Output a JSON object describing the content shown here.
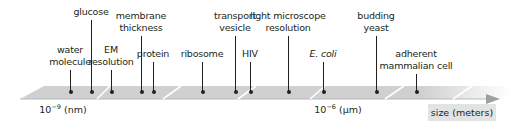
{
  "diagram": {
    "type": "log-scale size ruler",
    "axis_label": "size (meters)",
    "ticks": [
      {
        "base": "10",
        "exp": "−9",
        "unit": "(nm)",
        "x": 63
      },
      {
        "base": "10",
        "exp": "−6",
        "unit": "(µm)",
        "x": 338
      }
    ],
    "items": [
      {
        "label": [
          "water",
          "molecule"
        ],
        "x": 70,
        "line_top": 70,
        "italic": false
      },
      {
        "label": [
          "glucose"
        ],
        "x": 91,
        "line_top": 20,
        "italic": false
      },
      {
        "label": [
          "EM",
          "resolution"
        ],
        "x": 111,
        "line_top": 70,
        "italic": false
      },
      {
        "label": [
          "membrane",
          "thickness"
        ],
        "x": 141,
        "line_top": 36,
        "italic": false
      },
      {
        "label": [
          "protein"
        ],
        "x": 153,
        "line_top": 62,
        "italic": false
      },
      {
        "label": [
          "ribosome"
        ],
        "x": 202,
        "line_top": 62,
        "italic": false
      },
      {
        "label": [
          "transport",
          "vesicle"
        ],
        "x": 235,
        "line_top": 36,
        "italic": false
      },
      {
        "label": [
          "HIV"
        ],
        "x": 250,
        "line_top": 62,
        "italic": false
      },
      {
        "label": [
          "light microscope",
          "resolution"
        ],
        "x": 288,
        "line_top": 36,
        "italic": false
      },
      {
        "label": [
          "E. coli"
        ],
        "x": 323,
        "line_top": 62,
        "italic": true
      },
      {
        "label": [
          "budding",
          "yeast"
        ],
        "x": 376,
        "line_top": 36,
        "italic": false
      },
      {
        "label": [
          "adherent",
          "mammalian cell"
        ],
        "x": 416,
        "line_top": 74,
        "italic": false
      }
    ],
    "colors": {
      "band": "#cfd0d1",
      "band_divider": "#ffffff",
      "text": "#231f20",
      "unit_box": "#e2e3e3"
    }
  }
}
